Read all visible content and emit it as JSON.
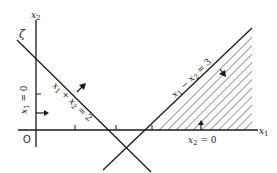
{
  "diagram": {
    "axes": {
      "x_label": "x1",
      "x_sub": "1",
      "y_label": "x2",
      "y_sub": "2",
      "origin_label": "O"
    },
    "constraints": [
      {
        "id": "c1",
        "label": "x1 + x2 = 2",
        "text_main": "x",
        "parts": [
          "x",
          "1",
          " + ",
          "x",
          "2",
          " = 2"
        ]
      },
      {
        "id": "c2",
        "label": "x1 − x2 = 3",
        "parts": [
          "x",
          "1",
          " − ",
          "x",
          "2",
          " = 3"
        ]
      },
      {
        "id": "c3",
        "label": "x1 = 0",
        "parts": [
          "x",
          "1",
          " = 0"
        ]
      },
      {
        "id": "c4",
        "label": "x2 = 0",
        "parts": [
          "x",
          "2",
          " = 0"
        ]
      }
    ],
    "corner_mark": "ζ",
    "shaded_region": "x1 − x2 ≥ 3, x2 ≥ 0",
    "colors": {
      "line": "#1a1a1a",
      "hatch": "#333333",
      "background": "#ffffff"
    }
  }
}
